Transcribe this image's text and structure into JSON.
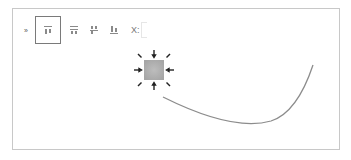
{
  "toolbar": {
    "collapse_glyph": "»",
    "buttons": [
      {
        "name": "align-top",
        "selected": true
      },
      {
        "name": "align-middle",
        "selected": false
      },
      {
        "name": "align-bottom-split",
        "selected": false
      },
      {
        "name": "align-bottom",
        "selected": false
      }
    ],
    "x_label": "X:",
    "x_value": ""
  },
  "canvas": {
    "shape": "sun-burst",
    "shape_fill": "#b4b4b4",
    "curve_color": "#8c8c8c",
    "border_color": "#c8c8c8"
  }
}
